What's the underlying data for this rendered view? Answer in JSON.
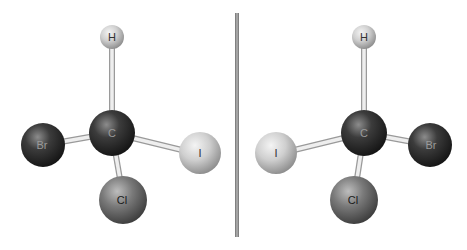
{
  "diagram": {
    "mirror": {
      "x": 237,
      "y1": 13,
      "y2": 237,
      "color": "#8a8a8a"
    },
    "molecules": [
      {
        "name": "left-enantiomer",
        "atoms": [
          {
            "id": "H",
            "label": "H",
            "cx": 112,
            "cy": 37,
            "r": 12,
            "fill": "light"
          },
          {
            "id": "C",
            "label": "C",
            "cx": 112,
            "cy": 133,
            "r": 23,
            "fill": "dark"
          },
          {
            "id": "Br",
            "label": "Br",
            "cx": 43,
            "cy": 145,
            "r": 22,
            "fill": "dark"
          },
          {
            "id": "I",
            "label": "I",
            "cx": 200,
            "cy": 153,
            "r": 21,
            "fill": "light"
          },
          {
            "id": "Cl",
            "label": "Cl",
            "cx": 123,
            "cy": 200,
            "r": 24,
            "fill": "mid"
          }
        ]
      },
      {
        "name": "right-enantiomer",
        "atoms": [
          {
            "id": "H",
            "label": "H",
            "cx": 364,
            "cy": 37,
            "r": 12,
            "fill": "light"
          },
          {
            "id": "C",
            "label": "C",
            "cx": 364,
            "cy": 133,
            "r": 23,
            "fill": "dark"
          },
          {
            "id": "I",
            "label": "I",
            "cx": 276,
            "cy": 153,
            "r": 21,
            "fill": "light"
          },
          {
            "id": "Br",
            "label": "Br",
            "cx": 430,
            "cy": 145,
            "r": 22,
            "fill": "dark"
          },
          {
            "id": "Cl",
            "label": "Cl",
            "cx": 354,
            "cy": 200,
            "r": 24,
            "fill": "mid"
          }
        ]
      }
    ],
    "labels": {
      "left_H": "H",
      "left_C": "C",
      "left_Br": "Br",
      "left_I": "I",
      "left_Cl": "Cl",
      "right_H": "H",
      "right_C": "C",
      "right_I": "I",
      "right_Br": "Br",
      "right_Cl": "Cl"
    },
    "colors": {
      "dark_atom": "#2e2e2e",
      "mid_atom": "#6e6e6e",
      "light_atom": "#c9c9c9",
      "bond": "#e6e6e6",
      "bond_edge": "#9a9a9a",
      "label_dark": "#111111"
    }
  }
}
